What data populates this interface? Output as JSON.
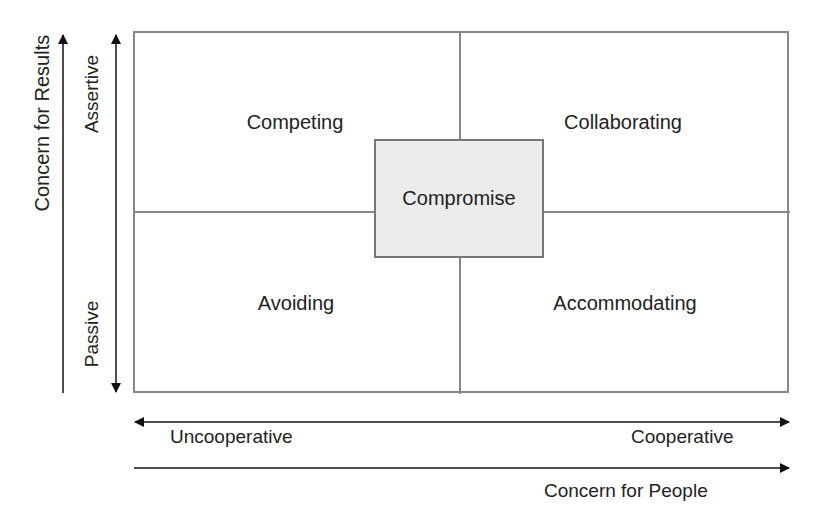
{
  "diagram": {
    "quadrants": {
      "top_left": "Competing",
      "top_right": "Collaborating",
      "bottom_left": "Avoiding",
      "bottom_right": "Accommodating"
    },
    "center": "Compromise",
    "vertical_axis": {
      "title": "Concern for Results",
      "high": "Assertive",
      "low": "Passive"
    },
    "horizontal_axis": {
      "title": "Concern for People",
      "low": "Uncooperative",
      "high": "Cooperative"
    },
    "colors": {
      "grid": "#888888",
      "center_fill": "#ececec",
      "arrows": "#111111"
    }
  }
}
